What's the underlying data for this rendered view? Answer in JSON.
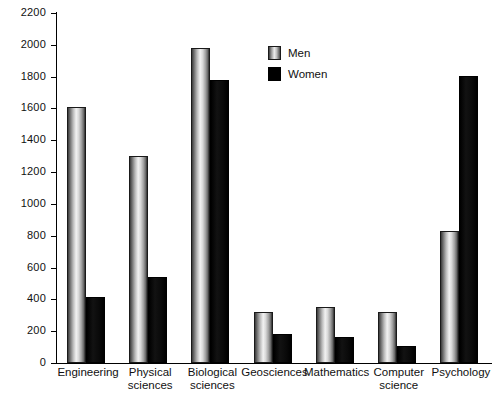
{
  "chart_data": {
    "type": "bar",
    "title": "",
    "subtitle": "",
    "xlabel": "",
    "ylabel": "",
    "ylim": [
      0,
      2200
    ],
    "ytick_step": 200,
    "yticks": [
      "0",
      "200",
      "400",
      "600",
      "800",
      "1000",
      "1200",
      "1400",
      "1600",
      "1800",
      "2000",
      "2200"
    ],
    "grid": false,
    "legend_position": "top-center-right",
    "categories": [
      "Engineering",
      "Physical\nsciences",
      "Biological\nsciences",
      "Geosciences",
      "Mathematics",
      "Computer\nscience",
      "Psychology"
    ],
    "series": [
      {
        "name": "Men",
        "color": "#c8c8c8",
        "style": "light-gradient",
        "values": [
          1610,
          1300,
          1980,
          320,
          355,
          320,
          830
        ]
      },
      {
        "name": "Women",
        "color": "#000000",
        "style": "solid-black",
        "values": [
          415,
          540,
          1780,
          180,
          165,
          105,
          1805
        ]
      }
    ]
  },
  "legend": {
    "items": [
      {
        "label": "Men",
        "swatch": "men-swatch"
      },
      {
        "label": "Women",
        "swatch": "women-swatch"
      }
    ]
  },
  "axes": {
    "y_axis_name": "y-axis",
    "x_axis_name": "x-axis"
  }
}
